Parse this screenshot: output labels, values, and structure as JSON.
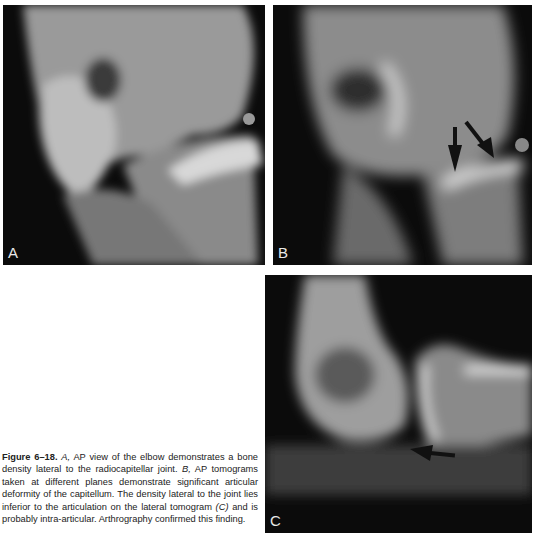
{
  "figure": {
    "number_label": "Figure 6–18.",
    "panels": [
      {
        "id": "A",
        "label": "A",
        "description": "AP radiograph of the elbow"
      },
      {
        "id": "B",
        "label": "B",
        "description": "AP tomogram with two arrows"
      },
      {
        "id": "C",
        "label": "C",
        "description": "Lateral tomogram with one arrow"
      }
    ],
    "caption": {
      "seg1_italic": "A,",
      "seg2": " AP view of the elbow demonstrates a bone density lateral to the radiocapitellar joint. ",
      "seg3_italic": "B,",
      "seg4": " AP tomograms taken at different planes demonstrate significant articular deformity of the capitellum. The density lateral to the joint lies inferior to the articulation on the lateral tomogram ",
      "seg5_italic": "(C)",
      "seg6": " and is probably intra-articular. Arthrography confirmed this finding."
    }
  }
}
